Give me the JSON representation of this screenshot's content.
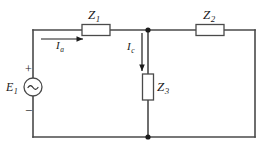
{
  "diagram": {
    "background_color": "#ffffff",
    "wire_color": "#4a4a4a",
    "label_color": "#1a1a1a",
    "components": {
      "source": {
        "name": "ac-voltage-source",
        "label_main": "E",
        "label_sub": "1",
        "symbol": "~",
        "polarity_plus": "+",
        "polarity_minus": "−"
      },
      "impedance_1": {
        "name": "impedance-z1",
        "label_main": "Z",
        "label_sub": "1"
      },
      "impedance_2": {
        "name": "impedance-z2",
        "label_main": "Z",
        "label_sub": "2"
      },
      "impedance_3": {
        "name": "impedance-z3",
        "label_main": "Z",
        "label_sub": "3"
      }
    },
    "currents": {
      "branch_a": {
        "name": "current-ia",
        "label_main": "I",
        "label_sub": "a",
        "direction": "right"
      },
      "branch_c": {
        "name": "current-ic",
        "label_main": "I",
        "label_sub": "c",
        "direction": "down"
      }
    },
    "nodes": {
      "top_junction": "node-top",
      "bottom_junction": "node-bottom"
    }
  }
}
